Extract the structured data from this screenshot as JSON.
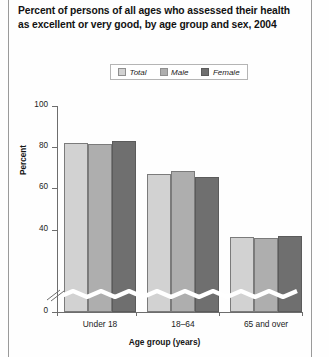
{
  "chart_data": {
    "type": "bar",
    "title": "Percent of persons of all ages who assessed their health as excellent or very good, by age group and sex, 2004",
    "xlabel": "Age group (years)",
    "ylabel": "Percent",
    "categories": [
      "Under 18",
      "18–64",
      "65 and over"
    ],
    "series": [
      {
        "name": "Total",
        "values": [
          82,
          67,
          36.5
        ],
        "color": "#d2d2d2"
      },
      {
        "name": "Male",
        "values": [
          81.5,
          68.5,
          36
        ],
        "color": "#aeaeae"
      },
      {
        "name": "Female",
        "values": [
          83,
          65.5,
          37
        ],
        "color": "#6f6f6f"
      }
    ],
    "ylim": [
      0,
      100
    ],
    "yticks": [
      "0",
      "40",
      "60",
      "80",
      "100"
    ],
    "ytick_values": [
      0,
      40,
      60,
      80,
      100
    ],
    "axis_break": true,
    "axis_break_between": [
      0,
      40
    ],
    "grid": false,
    "legend_position": "top-center"
  },
  "legend": {
    "items": [
      {
        "label": "Total"
      },
      {
        "label": "Male"
      },
      {
        "label": "Female"
      }
    ]
  }
}
